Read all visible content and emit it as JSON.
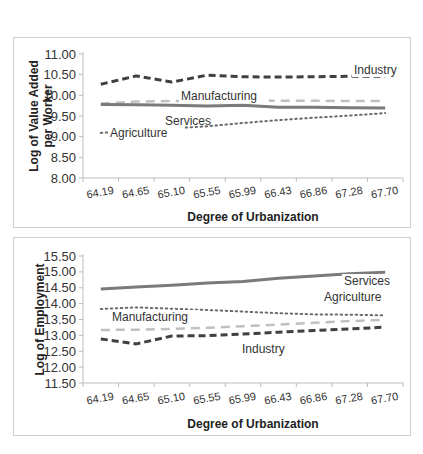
{
  "chart_data": [
    {
      "type": "line",
      "title": "",
      "xlabel": "Degree of Urbanization",
      "ylabel": "Log of Value Added per Worker",
      "ylabel_lines": [
        "Log of Value Added",
        "per Worker"
      ],
      "ylim": [
        8.0,
        11.0
      ],
      "yticks": [
        "11.00",
        "10.50",
        "10.00",
        "9.50",
        "9.00",
        "8.50",
        "8.00"
      ],
      "categories": [
        "64.19",
        "64.65",
        "65.10",
        "65.55",
        "65.99",
        "66.43",
        "66.86",
        "67.28",
        "67.70"
      ],
      "grid": false,
      "legend": "inline labels",
      "series": [
        {
          "name": "Industry",
          "style": "dashed-dark",
          "values": [
            10.27,
            10.47,
            10.32,
            10.49,
            10.45,
            10.44,
            10.45,
            10.46,
            10.46
          ]
        },
        {
          "name": "Manufacturing",
          "style": "dashed-light",
          "values": [
            9.8,
            9.85,
            9.86,
            9.86,
            9.88,
            9.87,
            9.87,
            9.86,
            9.86
          ]
        },
        {
          "name": "Services",
          "style": "solid",
          "values": [
            9.78,
            9.77,
            9.76,
            9.74,
            9.76,
            9.71,
            9.71,
            9.7,
            9.69
          ]
        },
        {
          "name": "Agriculture",
          "style": "dotted",
          "values": [
            9.09,
            9.14,
            9.2,
            9.25,
            9.33,
            9.4,
            9.46,
            9.51,
            9.57
          ]
        }
      ],
      "labels": {
        "industry": "Industry",
        "manufacturing": "Manufacturing",
        "services": "Services",
        "agriculture": "Agriculture"
      }
    },
    {
      "type": "line",
      "title": "",
      "xlabel": "Degree of Urbanization",
      "ylabel": "Log of Employment",
      "ylim": [
        11.5,
        15.5
      ],
      "yticks": [
        "15.50",
        "15.00",
        "14.50",
        "14.00",
        "13.50",
        "13.00",
        "12.50",
        "12.00",
        "11.50"
      ],
      "categories": [
        "64.19",
        "64.65",
        "65.10",
        "65.55",
        "65.99",
        "66.43",
        "66.86",
        "67.28",
        "67.70"
      ],
      "grid": false,
      "legend": "inline labels",
      "series": [
        {
          "name": "Services",
          "style": "solid",
          "values": [
            14.46,
            14.52,
            14.58,
            14.65,
            14.7,
            14.8,
            14.87,
            14.94,
            14.99
          ]
        },
        {
          "name": "Agriculture",
          "style": "dotted",
          "values": [
            13.83,
            13.88,
            13.84,
            13.8,
            13.75,
            13.7,
            13.66,
            13.65,
            13.63
          ]
        },
        {
          "name": "Manufacturing",
          "style": "dashed-light",
          "values": [
            13.17,
            13.18,
            13.2,
            13.24,
            13.29,
            13.34,
            13.4,
            13.45,
            13.49
          ]
        },
        {
          "name": "Industry",
          "style": "dashed-dark",
          "values": [
            12.89,
            12.73,
            12.98,
            12.99,
            13.04,
            13.1,
            13.15,
            13.2,
            13.26
          ]
        }
      ],
      "labels": {
        "services": "Services",
        "agriculture": "Agriculture",
        "manufacturing": "Manufacturing",
        "industry": "Industry"
      }
    }
  ],
  "colors": {
    "industry": "#404040",
    "manufacturing": "#c0c0c0",
    "services": "#7a7a7a",
    "agriculture": "#6a6a6a",
    "axis": "#bdbdbd",
    "frame": "#cfcfcf"
  }
}
